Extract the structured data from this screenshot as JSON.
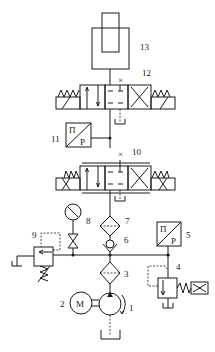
{
  "diagram": {
    "type": "hydraulic-circuit",
    "labels": {
      "c1": "1",
      "c2": "2",
      "c3": "3",
      "c4": "4",
      "c5": "5",
      "c6": "6",
      "c7": "7",
      "c8": "8",
      "c9": "9",
      "c10": "10",
      "c11": "11",
      "c12": "12",
      "c13": "13"
    },
    "symbols": {
      "motor": "M",
      "pressure_switch": "P",
      "pressure_switch_top": "Π"
    },
    "components": [
      {
        "id": "1",
        "name": "hydraulic pump"
      },
      {
        "id": "2",
        "name": "electric motor"
      },
      {
        "id": "3",
        "name": "filter"
      },
      {
        "id": "4",
        "name": "relief / unloading valve"
      },
      {
        "id": "5",
        "name": "pressure switch"
      },
      {
        "id": "6",
        "name": "check valve"
      },
      {
        "id": "7",
        "name": "filter"
      },
      {
        "id": "8",
        "name": "pressure gauge"
      },
      {
        "id": "9",
        "name": "relief valve"
      },
      {
        "id": "10",
        "name": "4/3 directional valve"
      },
      {
        "id": "11",
        "name": "pressure switch"
      },
      {
        "id": "12",
        "name": "4/3 directional valve"
      },
      {
        "id": "13",
        "name": "hydraulic cylinder"
      }
    ]
  }
}
